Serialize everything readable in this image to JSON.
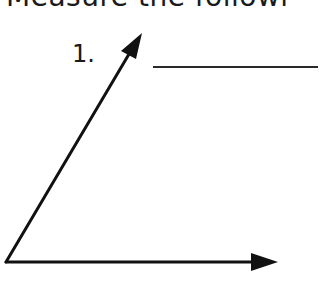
{
  "header": {
    "text": "Measure the followi"
  },
  "question": {
    "number": "1.",
    "answer_value": ""
  },
  "diagram": {
    "type": "angle",
    "vertex": [
      6,
      262
    ],
    "ray1_tip": [
      142,
      33
    ],
    "ray2_tip": [
      278,
      262
    ],
    "stroke_color": "#111111"
  }
}
